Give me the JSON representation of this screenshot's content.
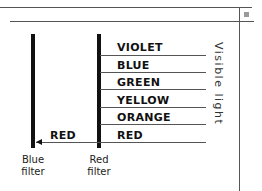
{
  "diagram": {
    "bands": [
      {
        "label": "VIOLET"
      },
      {
        "label": "BLUE"
      },
      {
        "label": "GREEN"
      },
      {
        "label": "YELLOW"
      },
      {
        "label": "ORANGE"
      },
      {
        "label": "RED"
      }
    ],
    "transmitted_label": "RED",
    "side_label": "Visible light",
    "filters": [
      {
        "line1": "Blue",
        "line2": "filter"
      },
      {
        "line1": "Red",
        "line2": "filter"
      }
    ]
  },
  "colors": {
    "line": "#555555",
    "bar": "#111111",
    "corner_square": "#9a9a9a"
  }
}
